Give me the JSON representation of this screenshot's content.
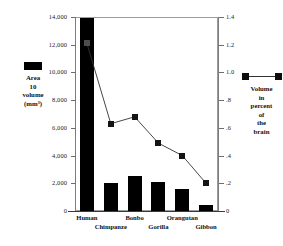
{
  "chart_data": {
    "type": "bar",
    "title": "",
    "categories": [
      "Human",
      "Chimpanze",
      "Bonbo",
      "Gorilla",
      "Orangutan",
      "Gibbon"
    ],
    "series": [
      {
        "name": "Area 10 volume (mm³)",
        "type": "bar",
        "axis": "left",
        "values": [
          13900,
          2000,
          2500,
          2100,
          1600,
          400
        ]
      },
      {
        "name": "Volume in percent of the brain",
        "type": "line",
        "axis": "right",
        "values": [
          1.21,
          0.63,
          0.68,
          0.49,
          0.4,
          0.2
        ]
      }
    ],
    "xlabel": "",
    "ylabel": "Area 10 volume (mm³)",
    "y2label": "Volume in percent of the brain",
    "ylim": [
      0,
      14000
    ],
    "y2lim": [
      0,
      1.4
    ],
    "yticks": [
      "0",
      "2,000",
      "4,000",
      "6,000",
      "8,000",
      "10,000",
      "12,000",
      "14,000"
    ],
    "ytick_values": [
      0,
      2000,
      4000,
      6000,
      8000,
      10000,
      12000,
      14000
    ],
    "y2ticks": [
      "0",
      ".2",
      ".4",
      ".6",
      ".8",
      "1.0",
      "1.2",
      "1.4"
    ],
    "y2tick_values": [
      0,
      0.2,
      0.4,
      0.6,
      0.8,
      1.0,
      1.2,
      1.4
    ],
    "grid": false,
    "legend_position": "outside-left-and-right",
    "bar_color": "#000000",
    "line_color": "#333333",
    "marker_color": "#141414"
  },
  "legend_left": {
    "marker": "filled-square",
    "lines": [
      "Area",
      "10",
      "volume",
      "(mm³)"
    ]
  },
  "legend_right": {
    "marker": "line-with-squares",
    "lines": [
      "Volume",
      "in",
      "percent",
      "of",
      "the",
      "brain"
    ]
  },
  "caption": {
    "text": ""
  }
}
